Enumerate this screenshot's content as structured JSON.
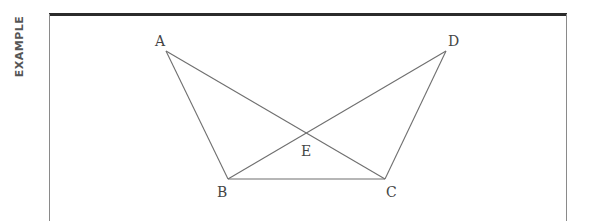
{
  "side_label": "EXAMPLE",
  "diagram": {
    "points": {
      "A": {
        "label": "A",
        "x": 166,
        "y": 51
      },
      "B": {
        "label": "B",
        "x": 228,
        "y": 179
      },
      "C": {
        "label": "C",
        "x": 385,
        "y": 179
      },
      "D": {
        "label": "D",
        "x": 446,
        "y": 51
      },
      "E": {
        "label": "E",
        "x": 306,
        "y": 133
      }
    },
    "segments": [
      "AB",
      "AC",
      "DB",
      "DC",
      "BC"
    ],
    "colors": {
      "line": "#6f6f6f",
      "label": "#444444",
      "frame": "#2b2b2b"
    }
  }
}
